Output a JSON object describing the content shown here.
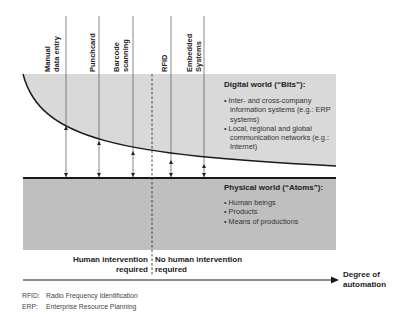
{
  "technologies": [
    {
      "label_line1": "Manual",
      "label_line2": "data entry"
    },
    {
      "label_line1": "Punchcard",
      "label_line2": ""
    },
    {
      "label_line1": "Barcode",
      "label_line2": "scanning"
    },
    {
      "label_line1": "RFID",
      "label_line2": ""
    },
    {
      "label_line1": "Embedded",
      "label_line2": "Systems"
    }
  ],
  "digital_world": {
    "title": "Digital world (“Bits”):",
    "bullets": [
      "• Inter- and cross-company information systems (e.g.: ERP systems)",
      "• Local, regional and global communication networks (e.g.: Internet)"
    ]
  },
  "physical_world": {
    "title": "Physical world (“Atoms”):",
    "bullets": [
      "• Human beings",
      "• Products",
      "• Means of productions"
    ]
  },
  "intervention": {
    "left_line1": "Human intervention",
    "left_line2": "required",
    "right_line1": "No human intervention",
    "right_line2": "required"
  },
  "axis": {
    "label_line1": "Degree of",
    "label_line2": "automation"
  },
  "footnotes": [
    {
      "abbr": "RFID:",
      "text": "Radio Frequency Identification"
    },
    {
      "abbr": "ERP:",
      "text": "Enterprise Resource Planning"
    }
  ],
  "colors": {
    "top_box": "#d9d9d9",
    "bottom_box": "#bfbfbf",
    "line": "#1a1a1a"
  }
}
